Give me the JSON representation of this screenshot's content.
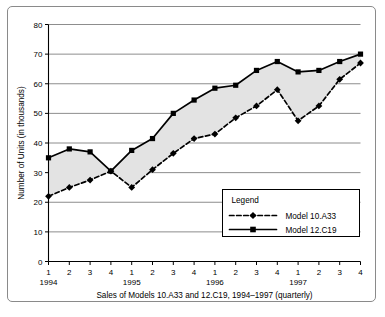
{
  "chart_data": {
    "type": "line",
    "title": "",
    "caption": "Sales of Models 10.A33 and 12.C19, 1994–1997 (quarterly)",
    "xlabel": "",
    "ylabel": "Number of Units (in thousands)",
    "ylim": [
      0,
      80
    ],
    "ytick_labels": [
      "0",
      "10",
      "20",
      "30",
      "40",
      "50",
      "60",
      "70",
      "80"
    ],
    "ytick_values": [
      0,
      10,
      20,
      30,
      40,
      50,
      60,
      70,
      80
    ],
    "grid": true,
    "grid_axis": "y",
    "legend_position": "inside-lower-right",
    "legend_title": "Legend",
    "x": [
      "1",
      "2",
      "3",
      "4",
      "1",
      "2",
      "3",
      "4",
      "1",
      "2",
      "3",
      "4",
      "1",
      "2",
      "3",
      "4"
    ],
    "x_groups": [
      {
        "label": "1994",
        "quarters": [
          "1",
          "2",
          "3",
          "4"
        ]
      },
      {
        "label": "1995",
        "quarters": [
          "1",
          "2",
          "3",
          "4"
        ]
      },
      {
        "label": "1996",
        "quarters": [
          "1",
          "2",
          "3",
          "4"
        ]
      },
      {
        "label": "1997",
        "quarters": [
          "1",
          "2",
          "3",
          "4"
        ]
      }
    ],
    "series": [
      {
        "name": "Model 10.A33",
        "style": "dashed",
        "marker": "diamond",
        "color": "#000000",
        "values": [
          22,
          25,
          27.5,
          30.5,
          25,
          31,
          36.5,
          41.5,
          43,
          48.5,
          52.5,
          58,
          47.5,
          52.5,
          61.5,
          67
        ]
      },
      {
        "name": "Model 12.C19",
        "style": "solid",
        "marker": "square",
        "color": "#000000",
        "values": [
          35,
          38,
          37,
          30.5,
          37.5,
          41.5,
          50,
          54.5,
          58.5,
          59.5,
          64.5,
          67.5,
          64,
          64.5,
          67.5,
          70
        ]
      }
    ],
    "band_fill_color": "#e3e3e3",
    "axis_color": "#000000",
    "grid_color": "#808080"
  },
  "legend": {
    "title": "Legend",
    "entries": [
      {
        "label": "Model 10.A33",
        "marker": "diamond",
        "line": "dashed"
      },
      {
        "label": "Model 12.C19",
        "marker": "square",
        "line": "solid"
      }
    ]
  },
  "axes": {
    "y_title": "Number of Units (in thousands)",
    "caption": "Sales of Models 10.A33 and 12.C19, 1994–1997 (quarterly)"
  }
}
